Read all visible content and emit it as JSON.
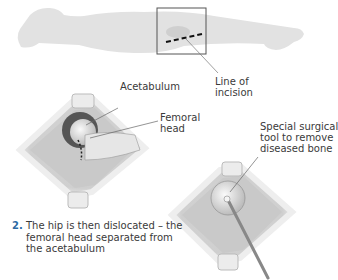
{
  "labels": {
    "incision": [
      "Line of",
      "incision"
    ],
    "acetabulum": "Acetabulum",
    "femoral_head": [
      "Femoral",
      "head"
    ],
    "tool": [
      "Special surgical",
      "tool to remove",
      "diseased bone"
    ]
  },
  "caption": {
    "number": "2.",
    "lines": [
      "The hip is then dislocated – the",
      "femoral head separated from",
      "the acetabulum"
    ]
  },
  "colors": {
    "accent_number": "#2d6aa3",
    "body_silhouette": "#e2e2e2"
  }
}
